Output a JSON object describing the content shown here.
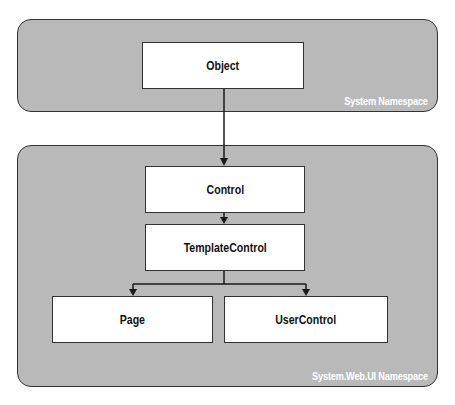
{
  "diagram": {
    "title": "",
    "colors": {
      "panel_fill": "#b9b9b9",
      "panel_border": "#333333",
      "box_fill": "#ffffff",
      "box_border": "#333333",
      "label_color": "#ffffff",
      "connector": "#1a1a1a"
    },
    "panels": [
      {
        "id": "system",
        "label": "System Namespace"
      },
      {
        "id": "system_web_ui",
        "label": "System.Web.UI Namespace"
      }
    ],
    "nodes": [
      {
        "id": "object",
        "label": "Object",
        "namespace": "System Namespace"
      },
      {
        "id": "control",
        "label": "Control",
        "namespace": "System.Web.UI Namespace"
      },
      {
        "id": "templatecontrol",
        "label": "TemplateControl",
        "namespace": "System.Web.UI Namespace"
      },
      {
        "id": "page",
        "label": "Page",
        "namespace": "System.Web.UI Namespace"
      },
      {
        "id": "usercontrol",
        "label": "UserControl",
        "namespace": "System.Web.UI Namespace"
      }
    ],
    "edges": [
      {
        "from": "object",
        "to": "control"
      },
      {
        "from": "control",
        "to": "templatecontrol"
      },
      {
        "from": "templatecontrol",
        "to": "page"
      },
      {
        "from": "templatecontrol",
        "to": "usercontrol"
      }
    ]
  }
}
